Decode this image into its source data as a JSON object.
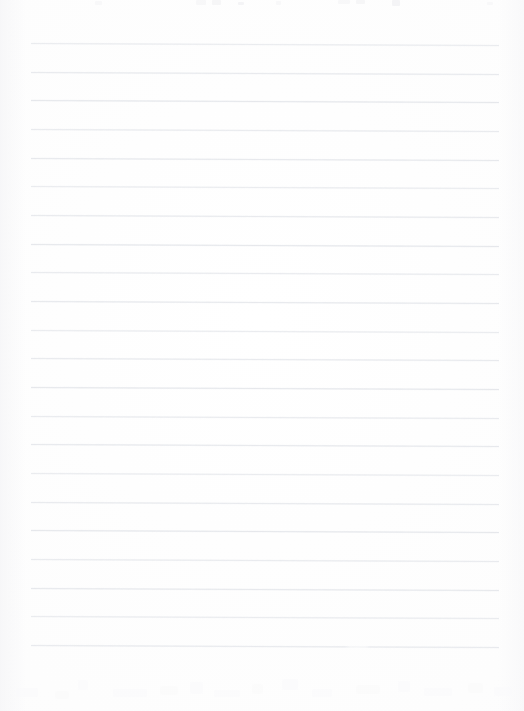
{
  "document": {
    "kind": "scanned-ruled-notebook-page",
    "title": "Blank lined notebook page",
    "page_width": 524,
    "page_height": 711,
    "body_text": "",
    "body_text_note": "No legible written content — page is blank ruled paper",
    "colors": {
      "paper_background": "#fdfdfd",
      "rule_line": "#e2e4e8",
      "rule_line_halo": "#e9ebef",
      "ghost_mark": "#f2f2f4",
      "residue_mark": "#fafafb",
      "edge_shadow": "#f5f5f7"
    }
  },
  "ruling": {
    "line_count": 22,
    "first_line_y": 43,
    "line_spacing": 28.7,
    "line_left_x": 31,
    "line_right_x": 499,
    "line_thickness": 1,
    "tilt_degrees": 0.26,
    "gapped_line_index": 21,
    "gap_start_fraction": 0.68,
    "gap_end_fraction": 0.72,
    "lines": [
      {
        "index": 0,
        "y": 43,
        "label": "rule-line-1",
        "gapped": false
      },
      {
        "index": 1,
        "y": 72,
        "label": "rule-line-2",
        "gapped": false
      },
      {
        "index": 2,
        "y": 100,
        "label": "rule-line-3",
        "gapped": false
      },
      {
        "index": 3,
        "y": 129,
        "label": "rule-line-4",
        "gapped": false
      },
      {
        "index": 4,
        "y": 158,
        "label": "rule-line-5",
        "gapped": false
      },
      {
        "index": 5,
        "y": 186,
        "label": "rule-line-6",
        "gapped": false
      },
      {
        "index": 6,
        "y": 215,
        "label": "rule-line-7",
        "gapped": false
      },
      {
        "index": 7,
        "y": 244,
        "label": "rule-line-8",
        "gapped": false
      },
      {
        "index": 8,
        "y": 272,
        "label": "rule-line-9",
        "gapped": false
      },
      {
        "index": 9,
        "y": 301,
        "label": "rule-line-10",
        "gapped": false
      },
      {
        "index": 10,
        "y": 330,
        "label": "rule-line-11",
        "gapped": false
      },
      {
        "index": 11,
        "y": 358,
        "label": "rule-line-12",
        "gapped": false
      },
      {
        "index": 12,
        "y": 387,
        "label": "rule-line-13",
        "gapped": false
      },
      {
        "index": 13,
        "y": 416,
        "label": "rule-line-14",
        "gapped": false
      },
      {
        "index": 14,
        "y": 444,
        "label": "rule-line-15",
        "gapped": false
      },
      {
        "index": 15,
        "y": 473,
        "label": "rule-line-16",
        "gapped": false
      },
      {
        "index": 16,
        "y": 502,
        "label": "rule-line-17",
        "gapped": false
      },
      {
        "index": 17,
        "y": 530,
        "label": "rule-line-18",
        "gapped": false
      },
      {
        "index": 18,
        "y": 559,
        "label": "rule-line-19",
        "gapped": false
      },
      {
        "index": 19,
        "y": 588,
        "label": "rule-line-20",
        "gapped": false
      },
      {
        "index": 20,
        "y": 616,
        "label": "rule-line-21",
        "gapped": false
      },
      {
        "index": 21,
        "y": 645,
        "label": "rule-line-22",
        "gapped": true
      }
    ]
  },
  "artifacts": {
    "top_clipped_text_row": {
      "present": true,
      "description": "Faint remnants of a clipped line of text at the very top edge",
      "marks": [
        {
          "x": 95,
          "y": 1,
          "w": 7,
          "h": 4
        },
        {
          "x": 196,
          "y": 0,
          "w": 10,
          "h": 5
        },
        {
          "x": 212,
          "y": 0,
          "w": 9,
          "h": 5
        },
        {
          "x": 238,
          "y": 2,
          "w": 6,
          "h": 3
        },
        {
          "x": 276,
          "y": 1,
          "w": 5,
          "h": 4
        },
        {
          "x": 338,
          "y": 0,
          "w": 12,
          "h": 4
        },
        {
          "x": 356,
          "y": 0,
          "w": 9,
          "h": 4
        },
        {
          "x": 392,
          "y": 0,
          "w": 8,
          "h": 6
        },
        {
          "x": 487,
          "y": 2,
          "w": 6,
          "h": 3
        }
      ]
    },
    "bottom_bleed_through": {
      "present": true,
      "description": "Very faint ghosting from the reverse side of the sheet",
      "marks": [
        {
          "x": 16,
          "y": 26,
          "w": 22,
          "h": 9
        },
        {
          "x": 55,
          "y": 29,
          "w": 14,
          "h": 8
        },
        {
          "x": 78,
          "y": 18,
          "w": 10,
          "h": 10
        },
        {
          "x": 113,
          "y": 27,
          "w": 34,
          "h": 8
        },
        {
          "x": 160,
          "y": 24,
          "w": 18,
          "h": 9
        },
        {
          "x": 190,
          "y": 20,
          "w": 13,
          "h": 12
        },
        {
          "x": 214,
          "y": 28,
          "w": 26,
          "h": 7
        },
        {
          "x": 252,
          "y": 22,
          "w": 11,
          "h": 10
        },
        {
          "x": 282,
          "y": 17,
          "w": 16,
          "h": 11
        },
        {
          "x": 312,
          "y": 27,
          "w": 20,
          "h": 8
        },
        {
          "x": 356,
          "y": 23,
          "w": 24,
          "h": 9
        },
        {
          "x": 398,
          "y": 19,
          "w": 12,
          "h": 11
        },
        {
          "x": 424,
          "y": 26,
          "w": 28,
          "h": 8
        },
        {
          "x": 468,
          "y": 21,
          "w": 15,
          "h": 10
        },
        {
          "x": 494,
          "y": 25,
          "w": 18,
          "h": 9
        }
      ]
    },
    "scan_edges": {
      "left_shadow": true,
      "right_shadow": true
    }
  }
}
